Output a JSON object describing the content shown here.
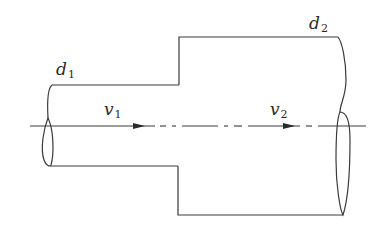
{
  "diagram": {
    "stroke_color": "#3a3a3a",
    "background": "#ffffff",
    "labels": {
      "d1": {
        "symbol": "d",
        "subscript": "1"
      },
      "d2": {
        "symbol": "d",
        "subscript": "2"
      },
      "v1": {
        "symbol": "v",
        "subscript": "1"
      },
      "v2": {
        "symbol": "v",
        "subscript": "2"
      }
    },
    "sections": [
      {
        "name": "small pipe",
        "diameter_label": "d1",
        "velocity_label": "v1"
      },
      {
        "name": "large pipe",
        "diameter_label": "d2",
        "velocity_label": "v2"
      }
    ],
    "centerline": {
      "style": "dash-dot",
      "direction": "left-to-right"
    }
  }
}
